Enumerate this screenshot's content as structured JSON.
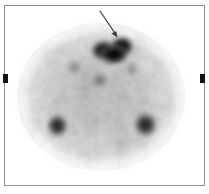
{
  "image": {
    "modality_label": "nuclear-medicine-scintigram",
    "view_label": "transaxial-section",
    "background_color": "#ffffff",
    "frame_color": "#8e8e8e",
    "marker_color": "#111111",
    "annotation_color": "#3a3a3a",
    "body": {
      "shape": "oval",
      "center_x": 101,
      "center_y": 97,
      "radius_x": 89,
      "radius_y": 79,
      "tracer_tone_light": "#f2f2f2",
      "tracer_tone_mid": "#b4b4b4",
      "tracer_tone_dark": "#6a6a6a"
    },
    "foci": [
      {
        "name": "anterior-midline-focus",
        "label": "arrow-marked uptake",
        "x": 113,
        "y": 48,
        "rx": 21,
        "ry": 13,
        "intensity": "very-high",
        "color": "#0c0c0c"
      },
      {
        "name": "posterior-left-focus",
        "x": 57,
        "y": 126,
        "rx": 9,
        "ry": 10,
        "intensity": "high",
        "color": "#1c1c1c"
      },
      {
        "name": "posterior-right-focus",
        "x": 146,
        "y": 125,
        "rx": 10,
        "ry": 11,
        "intensity": "high",
        "color": "#1c1c1c"
      },
      {
        "name": "central-faint-focus",
        "x": 100,
        "y": 80,
        "rx": 8,
        "ry": 7,
        "intensity": "moderate",
        "color": "#5a5a5a"
      }
    ],
    "annotation_arrow": {
      "name": "pointer-arrow",
      "from_x": 100,
      "from_y": 11,
      "to_x": 117,
      "to_y": 37,
      "stroke_width": 1.2,
      "head_size": 6
    },
    "markers": [
      {
        "name": "left-lateral-skin-marker",
        "side": "left",
        "x": 3,
        "y": 74,
        "width": 5,
        "height": 9
      },
      {
        "name": "right-lateral-skin-marker",
        "side": "right",
        "x": 200,
        "y": 74,
        "width": 5,
        "height": 9
      }
    ]
  }
}
